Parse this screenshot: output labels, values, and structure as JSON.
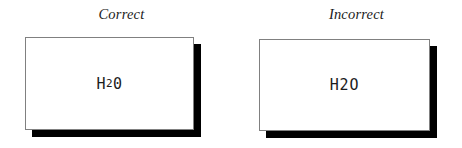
{
  "figure": {
    "background_color": "#ffffff",
    "shadow_color": "#000000",
    "border_color": "#808080",
    "text_color": "#1c1c1c"
  },
  "panels": [
    {
      "key": "correct",
      "label": "Correct",
      "formula": {
        "display": "H20",
        "base_before": "H",
        "subscript": "2",
        "base_after": "0",
        "has_subscript": true
      }
    },
    {
      "key": "incorrect",
      "label": "Incorrect",
      "formula": {
        "display": "H2O",
        "base_before": "H2O",
        "subscript": "",
        "base_after": "",
        "has_subscript": false
      }
    }
  ]
}
